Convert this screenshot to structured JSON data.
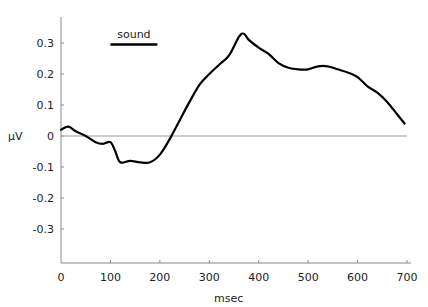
{
  "chart_data": {
    "type": "line",
    "title": "",
    "xlabel": "msec",
    "ylabel": "µV",
    "xlim": [
      0,
      700
    ],
    "ylim": [
      -0.4,
      0.38
    ],
    "grid": false,
    "legend": null,
    "x_ticks": [
      0,
      100,
      200,
      300,
      400,
      500,
      600,
      700
    ],
    "x_tick_labels": [
      "0",
      "100",
      "200",
      "300",
      "400",
      "500",
      "600",
      "700"
    ],
    "y_ticks": [
      0.3,
      0.2,
      0.1,
      0,
      -0.1,
      -0.2,
      -0.3
    ],
    "y_tick_labels": [
      "0.3",
      "0.2",
      "0.1",
      "0",
      "-0.1",
      "-0.2",
      "-0.3"
    ],
    "zero_line": true,
    "annotations": [
      {
        "type": "bar",
        "label": "sound",
        "x_start": 100,
        "x_end": 195,
        "y": 0.295
      }
    ],
    "series": [
      {
        "name": "ERP",
        "color": "#000000",
        "x": [
          0,
          15,
          30,
          50,
          70,
          85,
          100,
          110,
          120,
          140,
          160,
          180,
          200,
          220,
          240,
          260,
          280,
          300,
          320,
          340,
          360,
          370,
          380,
          400,
          420,
          440,
          460,
          480,
          500,
          520,
          540,
          560,
          580,
          600,
          620,
          640,
          660,
          680,
          695
        ],
        "values": [
          0.02,
          0.03,
          0.015,
          0.0,
          -0.02,
          -0.025,
          -0.02,
          -0.05,
          -0.085,
          -0.08,
          -0.085,
          -0.085,
          -0.06,
          -0.01,
          0.05,
          0.11,
          0.165,
          0.2,
          0.23,
          0.26,
          0.32,
          0.33,
          0.31,
          0.285,
          0.265,
          0.235,
          0.22,
          0.215,
          0.215,
          0.225,
          0.225,
          0.215,
          0.205,
          0.19,
          0.16,
          0.14,
          0.11,
          0.07,
          0.04
        ]
      }
    ]
  },
  "labels": {
    "ylabel": "µV",
    "xlabel": "msec",
    "sound": "sound"
  }
}
